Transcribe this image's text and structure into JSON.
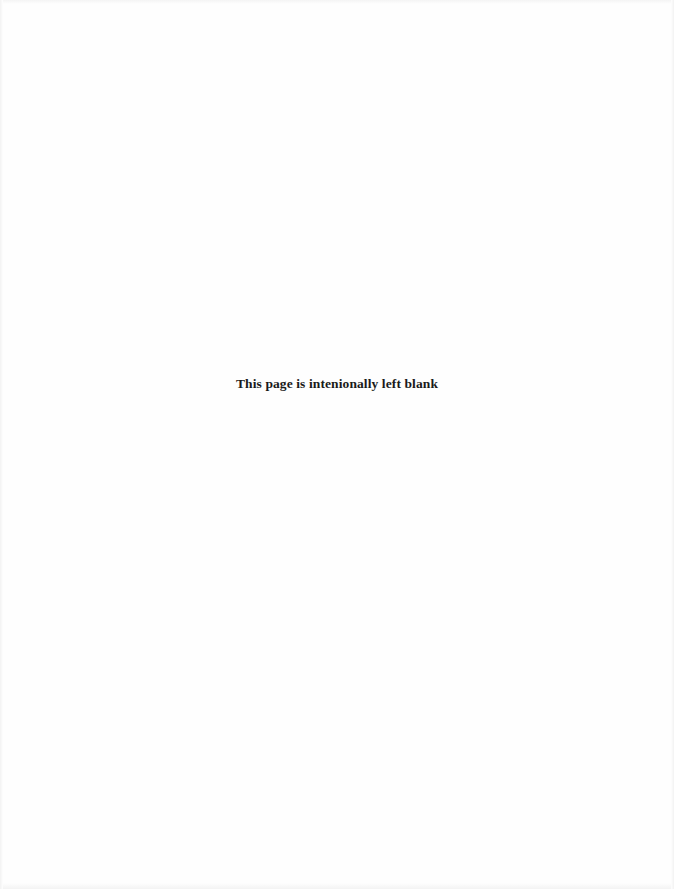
{
  "page": {
    "notice_text": "This page is intenionally left blank",
    "background_color": "#fefefe",
    "text_color": "#1a1a1a"
  }
}
